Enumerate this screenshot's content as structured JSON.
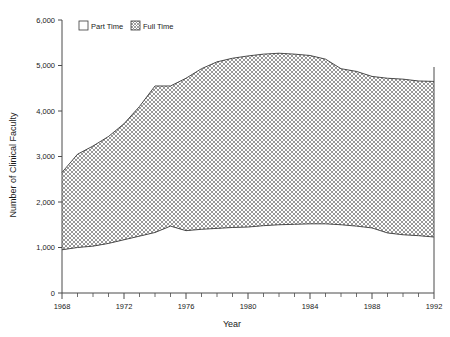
{
  "chart_data": {
    "type": "area",
    "title": "",
    "xlabel": "Year",
    "ylabel": "Number of Clinical Faculty",
    "xlim": [
      1968,
      1992
    ],
    "ylim": [
      0,
      6000
    ],
    "ytick_labels": [
      "0",
      "1,000",
      "2,000",
      "3,000",
      "4,000",
      "5,000",
      "6,000"
    ],
    "ytick_values": [
      0,
      1000,
      2000,
      3000,
      4000,
      5000,
      6000
    ],
    "xtick_labels": [
      "1968",
      "1972",
      "1976",
      "1980",
      "1984",
      "1988",
      "1992"
    ],
    "xtick_values": [
      1968,
      1972,
      1976,
      1980,
      1984,
      1988,
      1992
    ],
    "xtick_minor_step": 1,
    "grid": false,
    "stacked": true,
    "legend_position": "top-left-inside",
    "x": [
      1968,
      1969,
      1970,
      1971,
      1972,
      1973,
      1974,
      1975,
      1976,
      1977,
      1978,
      1979,
      1980,
      1981,
      1982,
      1983,
      1984,
      1985,
      1986,
      1987,
      1988,
      1989,
      1990,
      1991,
      1992
    ],
    "series": [
      {
        "name": "Full Time",
        "pattern": "cross-hatch",
        "color": "#8c8c8c",
        "values": [
          950,
          1000,
          1030,
          1090,
          1170,
          1250,
          1330,
          1470,
          1370,
          1400,
          1420,
          1440,
          1450,
          1480,
          1500,
          1510,
          1520,
          1520,
          1500,
          1470,
          1430,
          1320,
          1280,
          1260,
          1230
        ]
      },
      {
        "name": "Part Time",
        "pattern": "solid-white",
        "color": "#ffffff",
        "values": [
          1700,
          2050,
          2200,
          2350,
          2550,
          2850,
          3220,
          3080,
          3350,
          3530,
          3660,
          3720,
          3760,
          3770,
          3770,
          3740,
          3700,
          3620,
          3430,
          3400,
          3330,
          3400,
          3420,
          3400,
          3420
        ]
      }
    ],
    "cumulative_top": [
      2650,
      3050,
      3230,
      3440,
      3720,
      4100,
      4550,
      4550,
      4720,
      4930,
      5080,
      5160,
      5210,
      5250,
      5270,
      5250,
      5220,
      5140,
      4930,
      4870,
      4760,
      4720,
      4700,
      4660,
      4650
    ]
  },
  "legend": {
    "items": [
      {
        "label": "Part Time",
        "swatch": "open-square"
      },
      {
        "label": "Full Time",
        "swatch": "hatched-square"
      }
    ]
  }
}
